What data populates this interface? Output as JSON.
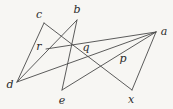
{
  "figure": {
    "type": "geometric-line-diagram",
    "width": 173,
    "height": 109,
    "background_color": "#f7f6f3",
    "stroke_color": "#4a4a4a",
    "label_color": "#2b2b2b",
    "stroke_width": 0.9,
    "points": [
      {
        "id": "a",
        "label": "a",
        "kind": "vertex",
        "x": 156,
        "y": 32,
        "label_x": 164,
        "label_y": 31
      },
      {
        "id": "b",
        "label": "b",
        "kind": "vertex",
        "x": 77,
        "y": 20,
        "label_x": 77,
        "label_y": 9
      },
      {
        "id": "c",
        "label": "c",
        "kind": "vertex",
        "x": 44,
        "y": 23,
        "label_x": 39,
        "label_y": 14
      },
      {
        "id": "d",
        "label": "d",
        "kind": "vertex",
        "x": 17,
        "y": 82,
        "label_x": 10,
        "label_y": 84
      },
      {
        "id": "e",
        "label": "e",
        "kind": "vertex",
        "x": 62,
        "y": 90,
        "label_x": 62,
        "label_y": 100
      },
      {
        "id": "x",
        "label": "x",
        "kind": "vertex",
        "x": 132,
        "y": 90,
        "label_x": 131,
        "label_y": 99
      },
      {
        "id": "p",
        "label": "p",
        "kind": "intersection",
        "x": 125,
        "y": 63,
        "label_x": 123,
        "label_y": 58
      },
      {
        "id": "q",
        "label": "q",
        "kind": "intersection",
        "x": 88,
        "y": 49,
        "label_x": 86,
        "label_y": 47
      },
      {
        "id": "r",
        "label": "r",
        "kind": "intersection",
        "x": 46,
        "y": 49,
        "label_x": 39,
        "label_y": 46
      }
    ],
    "segments": [
      {
        "id": "c-x",
        "from": "c",
        "to": "x",
        "x1": 44,
        "y1": 23,
        "x2": 132,
        "y2": 90
      },
      {
        "id": "c-d",
        "from": "c",
        "to": "d",
        "x1": 44,
        "y1": 23,
        "x2": 17,
        "y2": 82
      },
      {
        "id": "b-e",
        "from": "b",
        "to": "e",
        "x1": 77,
        "y1": 20,
        "x2": 62,
        "y2": 90
      },
      {
        "id": "b-d",
        "from": "b",
        "to": "d",
        "x1": 77,
        "y1": 20,
        "x2": 17,
        "y2": 82
      },
      {
        "id": "d-a",
        "from": "d",
        "to": "a",
        "x1": 17,
        "y1": 82,
        "x2": 156,
        "y2": 32
      },
      {
        "id": "e-a",
        "from": "e",
        "to": "a",
        "x1": 62,
        "y1": 90,
        "x2": 156,
        "y2": 32
      },
      {
        "id": "a-x",
        "from": "a",
        "to": "x",
        "x1": 156,
        "y1": 32,
        "x2": 132,
        "y2": 90
      },
      {
        "id": "r-a",
        "from": "r",
        "to": "a",
        "x1": 46,
        "y1": 49,
        "x2": 156,
        "y2": 32
      }
    ]
  }
}
